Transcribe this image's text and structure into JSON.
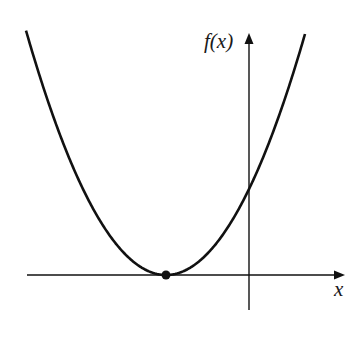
{
  "figure": {
    "y_axis_label": "f(x)",
    "x_axis_label": "x",
    "colors": {
      "line": "#111111",
      "background": "#ffffff"
    }
  },
  "chart_data": {
    "type": "line",
    "title": "",
    "xlabel": "x",
    "ylabel": "f(x)",
    "vertex": {
      "marked": true,
      "on_x_axis": true,
      "position": "left of origin"
    },
    "grid": false,
    "tick_labels": [],
    "pixel_geometry": {
      "origin": [
        249,
        275
      ],
      "vertex": [
        166,
        275
      ],
      "y_intercept": [
        249,
        189
      ],
      "curve_left_top": [
        26,
        31
      ],
      "curve_right_top": [
        305,
        34
      ],
      "x_axis": {
        "from": [
          27,
          275
        ],
        "to": [
          345,
          275
        ]
      },
      "y_axis": {
        "from": [
          249,
          310
        ],
        "to": [
          249,
          33
        ]
      }
    }
  }
}
